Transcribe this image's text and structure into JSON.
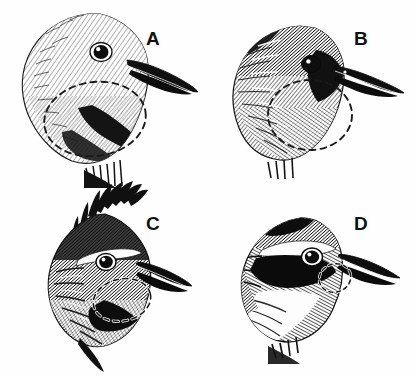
{
  "figure": {
    "background_color": "#fefefe",
    "ink_color": "#111111",
    "annotation_color": "#1a1a1a",
    "width": 417,
    "height": 376
  },
  "panels": [
    {
      "id": "a",
      "label": "A",
      "label_x": 153,
      "label_y": 38,
      "plumage": "pale finely streaked head, light crown and cheek, dark malar stripe, long slender decurved bill",
      "bill_tip_x": 197,
      "bill_tip_y": 92,
      "eye_x": 101,
      "eye_y": 52,
      "annotation": {
        "shape": "dashed-ellipse",
        "cx": 95,
        "cy": 119,
        "rx": 51,
        "ry": 37,
        "rotation": -8,
        "target": "throat and malar region"
      }
    },
    {
      "id": "b",
      "label": "B",
      "label_x": 361,
      "label_y": 38,
      "plumage": "dark heavily streaked head, blackish crown and nape, dark lores and bill, rounded crown",
      "bill_tip_x": 402,
      "bill_tip_y": 90,
      "eye_x": 311,
      "eye_y": 64,
      "annotation": {
        "shape": "dashed-ellipse",
        "cx": 310,
        "cy": 115,
        "rx": 42,
        "ry": 35,
        "rotation": 0,
        "target": "throat and malar region"
      }
    },
    {
      "id": "c",
      "label": "C",
      "label_x": 153,
      "label_y": 223,
      "plumage": "blackish crested head with spiky erect crest, bold white supercilium streak, dark throat",
      "bill_tip_x": 190,
      "bill_tip_y": 285,
      "eye_x": 106,
      "eye_y": 262,
      "annotation": {
        "shape": "dashed-ellipse",
        "cx": 122,
        "cy": 300,
        "rx": 29,
        "ry": 21,
        "rotation": -12,
        "target": "throat and malar region"
      }
    },
    {
      "id": "d",
      "label": "D",
      "label_x": 361,
      "label_y": 223,
      "plumage": "bold black facial mask and cheek, broad white supercilium, white throat and side of neck",
      "bill_tip_x": 398,
      "bill_tip_y": 278,
      "eye_x": 312,
      "eye_y": 257,
      "annotation": {
        "shape": "dashed-ellipse",
        "cx": 335,
        "cy": 278,
        "rx": 16,
        "ry": 14,
        "rotation": -20,
        "target": "throat and malar region"
      }
    }
  ]
}
